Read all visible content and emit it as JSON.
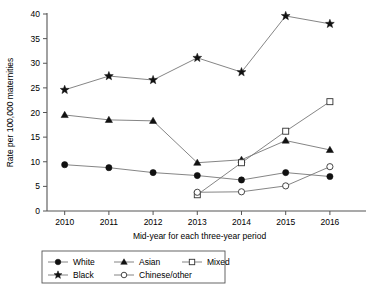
{
  "chart_data": {
    "type": "line",
    "title": "",
    "xlabel": "Mid-year for each three-year period",
    "ylabel": "Rate per 100,000 maternities",
    "x": [
      2010,
      2011,
      2012,
      2013,
      2014,
      2015,
      2016
    ],
    "categories": [
      "2010",
      "2011",
      "2012",
      "2013",
      "2014",
      "2015",
      "2016"
    ],
    "xlim": [
      2009.6,
      2016.5
    ],
    "ylim": [
      0,
      40
    ],
    "yticks": [
      0,
      5,
      10,
      15,
      20,
      25,
      30,
      35,
      40
    ],
    "ytick_labels": [
      "0",
      "5",
      "10",
      "15",
      "20",
      "25",
      "30",
      "35",
      "40"
    ],
    "grid": false,
    "legend_position": "bottom",
    "series": [
      {
        "name": "White",
        "marker": "filled-circle",
        "x": [
          2010,
          2011,
          2012,
          2013,
          2014,
          2015,
          2016
        ],
        "values": [
          9.4,
          8.8,
          7.8,
          7.2,
          6.3,
          7.8,
          7.0
        ]
      },
      {
        "name": "Asian",
        "marker": "filled-triangle",
        "x": [
          2010,
          2011,
          2012,
          2013,
          2014,
          2015,
          2016
        ],
        "values": [
          19.5,
          18.5,
          18.3,
          9.8,
          10.4,
          14.3,
          12.4
        ]
      },
      {
        "name": "Mixed",
        "marker": "open-square",
        "x": [
          2013,
          2014,
          2015,
          2016
        ],
        "values": [
          3.3,
          9.8,
          16.2,
          22.2
        ]
      },
      {
        "name": "Black",
        "marker": "filled-star",
        "x": [
          2010,
          2011,
          2012,
          2013,
          2014,
          2015,
          2016
        ],
        "values": [
          24.6,
          27.4,
          26.6,
          31.1,
          28.2,
          39.6,
          38.0
        ]
      },
      {
        "name": "Chinese/other",
        "marker": "open-circle",
        "x": [
          2013,
          2014,
          2015,
          2016
        ],
        "values": [
          3.8,
          3.9,
          5.1,
          9.0
        ]
      }
    ]
  },
  "legend": {
    "entries": [
      {
        "label": "White",
        "marker": "filled-circle"
      },
      {
        "label": "Asian",
        "marker": "filled-triangle"
      },
      {
        "label": "Mixed",
        "marker": "open-square"
      },
      {
        "label": "Black",
        "marker": "filled-star"
      },
      {
        "label": "Chinese/other",
        "marker": "open-circle"
      }
    ]
  },
  "colors": {
    "line": "#777777",
    "marker": "#111111",
    "axis": "#555555",
    "background": "#ffffff"
  }
}
